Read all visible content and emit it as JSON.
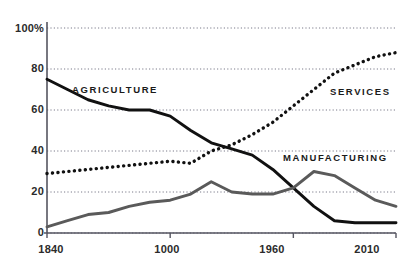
{
  "chart_data": {
    "type": "line",
    "title": "",
    "xlabel": "",
    "ylabel": "",
    "xlim": [
      1840,
      2010
    ],
    "ylim": [
      0,
      100
    ],
    "grid": true,
    "legend_position": "inline-annotations",
    "y_ticks": [
      "0",
      "20",
      "40",
      "60",
      "80",
      "100%"
    ],
    "y_tick_values": [
      0,
      20,
      40,
      60,
      80,
      100
    ],
    "x_ticks": [
      "1840",
      "1000",
      "1960",
      "2010"
    ],
    "x_tick_values": [
      1840,
      1900,
      1960,
      2010
    ],
    "series": [
      {
        "name": "AGRICULTURE",
        "style": "solid",
        "color": "#111111",
        "x": [
          1840,
          1850,
          1860,
          1870,
          1880,
          1890,
          1900,
          1910,
          1920,
          1930,
          1940,
          1950,
          1960,
          1970,
          1980,
          1990,
          2000,
          2010
        ],
        "values": [
          75,
          70,
          65,
          62,
          60,
          60,
          57,
          50,
          44,
          41,
          38,
          31,
          22,
          13,
          6,
          5,
          5,
          5
        ]
      },
      {
        "name": "SERVICES",
        "style": "dotted",
        "color": "#111111",
        "x": [
          1840,
          1850,
          1860,
          1870,
          1880,
          1890,
          1900,
          1910,
          1920,
          1930,
          1940,
          1950,
          1960,
          1970,
          1980,
          1990,
          2000,
          2010
        ],
        "values": [
          29,
          30,
          31,
          32,
          33,
          34,
          35,
          34,
          40,
          43,
          48,
          54,
          62,
          70,
          78,
          82,
          86,
          88
        ]
      },
      {
        "name": "MANUFACTURING",
        "style": "solid",
        "color": "#5a5a5a",
        "x": [
          1840,
          1850,
          1860,
          1870,
          1880,
          1890,
          1900,
          1910,
          1920,
          1930,
          1940,
          1950,
          1960,
          1970,
          1980,
          1990,
          2000,
          2010
        ],
        "values": [
          3,
          6,
          9,
          10,
          13,
          15,
          16,
          19,
          25,
          20,
          19,
          19,
          22,
          30,
          28,
          22,
          16,
          13
        ]
      }
    ],
    "annotations": [
      {
        "text": "AGRICULTURE",
        "x": 1868,
        "y": 70
      },
      {
        "text": "SERVICES",
        "x": 1985,
        "y": 69
      },
      {
        "text": "MANUFACTURING",
        "x": 1978,
        "y": 36
      }
    ]
  },
  "colors": {
    "agriculture": "#111111",
    "services": "#111111",
    "manufacturing": "#5a5a5a",
    "grid": "#7b7b8a",
    "axis": "#555560",
    "text": "#2b2b2b"
  }
}
